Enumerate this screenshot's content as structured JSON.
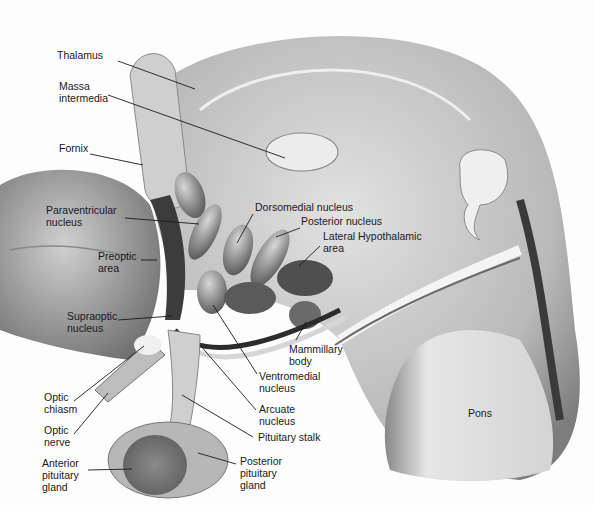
{
  "diagram": {
    "labels": [
      {
        "id": "thalamus",
        "text": "Thalamus",
        "x": 57,
        "y": 55,
        "lx1": 118,
        "ly1": 61,
        "lx2": 195,
        "ly2": 89
      },
      {
        "id": "massa",
        "text": "Massa\nintermedia",
        "x": 59,
        "y": 86,
        "lx1": 108,
        "ly1": 95,
        "lx2": 285,
        "ly2": 158
      },
      {
        "id": "fornix",
        "text": "Fornix",
        "x": 59,
        "y": 148,
        "lx1": 90,
        "ly1": 154,
        "lx2": 143,
        "ly2": 165
      },
      {
        "id": "paraventricular",
        "text": "Paraventricular\nnucleus",
        "x": 46,
        "y": 210,
        "lx1": 125,
        "ly1": 218,
        "lx2": 199,
        "ly2": 224
      },
      {
        "id": "preoptic",
        "text": "Preoptic\narea",
        "x": 98,
        "y": 256,
        "lx1": 141,
        "ly1": 260,
        "lx2": 157,
        "ly2": 260
      },
      {
        "id": "supraoptic",
        "text": "Supraoptic\nnucleus",
        "x": 67,
        "y": 316,
        "lx1": 118,
        "ly1": 320,
        "lx2": 172,
        "ly2": 316
      },
      {
        "id": "dorsomedial",
        "text": "Dorsomedial nucleus",
        "x": 255,
        "y": 207,
        "lx1": 253,
        "ly1": 214,
        "lx2": 237,
        "ly2": 243
      },
      {
        "id": "posterior",
        "text": "Posterior nucleus",
        "x": 301,
        "y": 221,
        "lx1": 300,
        "ly1": 228,
        "lx2": 276,
        "ly2": 237
      },
      {
        "id": "lateral",
        "text": "Lateral Hypothalamic\narea",
        "x": 323,
        "y": 236,
        "lx1": 320,
        "ly1": 246,
        "lx2": 299,
        "ly2": 266
      },
      {
        "id": "mammillary",
        "text": "Mammillary\nbody",
        "x": 289,
        "y": 349,
        "lx1": 306,
        "ly1": 322,
        "lx2": 296,
        "ly2": 340
      },
      {
        "id": "ventromedial",
        "text": "Ventromedial\nnucleus",
        "x": 259,
        "y": 376,
        "lx1": 257,
        "ly1": 374,
        "lx2": 213,
        "ly2": 305
      },
      {
        "id": "arcuate",
        "text": "Arcuate\nnucleus",
        "x": 259,
        "y": 409,
        "lx1": 256,
        "ly1": 410,
        "lx2": 200,
        "ly2": 345
      },
      {
        "id": "stalk",
        "text": "Pituitary stalk",
        "x": 258,
        "y": 437,
        "lx1": 253,
        "ly1": 437,
        "lx2": 182,
        "ly2": 395
      },
      {
        "id": "posterior_gland",
        "text": "Posterior\npituitary\ngland",
        "x": 240,
        "y": 461,
        "lx1": 236,
        "ly1": 464,
        "lx2": 198,
        "ly2": 453
      },
      {
        "id": "chiasm",
        "text": "Optic\nchiasm",
        "x": 44,
        "y": 397,
        "lx1": 74,
        "ly1": 401,
        "lx2": 144,
        "ly2": 346
      },
      {
        "id": "nerve",
        "text": "Optic\nnerve",
        "x": 44,
        "y": 430,
        "lx1": 74,
        "ly1": 434,
        "lx2": 108,
        "ly2": 393
      },
      {
        "id": "anterior_gland",
        "text": "Anterior\npituitary\ngland",
        "x": 42,
        "y": 463,
        "lx1": 88,
        "ly1": 470,
        "lx2": 132,
        "ly2": 469
      },
      {
        "id": "pons",
        "text": "Pons",
        "x": 468,
        "y": 413,
        "lx1": 0,
        "ly1": 0,
        "lx2": 0,
        "ly2": 0
      }
    ],
    "colors": {
      "ink": "#1a1a1a",
      "tissue_light": "#d9d9d9",
      "tissue_mid": "#a8a8a8",
      "tissue_dark": "#5a5a5a",
      "cavity": "#f2f2f2"
    }
  }
}
